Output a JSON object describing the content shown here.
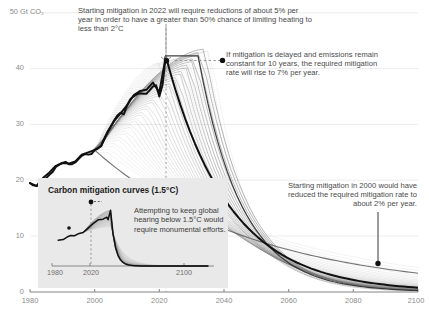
{
  "chart_data": {
    "type": "line",
    "title": "",
    "xlabel": "",
    "ylabel": "50 Gt CO2",
    "ylabel_display": "50 Gt CO₂",
    "xlim": [
      1980,
      2100
    ],
    "ylim": [
      0,
      50
    ],
    "grid": true,
    "legend_position": "none",
    "y_ticks": [
      "50 Gt CO₂",
      "40",
      "30",
      "20",
      "10",
      "0"
    ],
    "y_tick_values": [
      50,
      40,
      30,
      20,
      10,
      0
    ],
    "x_ticks": [
      "1980",
      "2000",
      "2020",
      "2040",
      "2060",
      "2080",
      "2100"
    ],
    "x_tick_values": [
      1980,
      2000,
      2020,
      2040,
      2060,
      2080,
      2100
    ],
    "series": [
      {
        "name": "Historical emissions",
        "style": "thick-black",
        "x": [
          1980,
          1982,
          1984,
          1986,
          1988,
          1990,
          1992,
          1994,
          1996,
          1998,
          2000,
          2002,
          2004,
          2006,
          2008,
          2010,
          2012,
          2014,
          2016,
          2018,
          2020,
          2022
        ],
        "values": [
          19.5,
          19.0,
          20.4,
          21.4,
          22.6,
          23.1,
          23.0,
          23.4,
          24.6,
          25.0,
          25.4,
          26.2,
          28.6,
          30.6,
          32.0,
          33.4,
          35.2,
          36.0,
          36.2,
          37.5,
          35.8,
          42.2
        ]
      },
      {
        "name": "Mitigation from 2022 (5% per year)",
        "style": "thick-black",
        "annotation_rate_percent": 5,
        "start_year": 2022,
        "x": [
          2022,
          2030,
          2040,
          2050,
          2060,
          2070,
          2080,
          2090,
          2100
        ],
        "values": [
          42.2,
          38.0,
          28.5,
          18.5,
          10.5,
          5.6,
          3.0,
          1.6,
          0.9
        ]
      },
      {
        "name": "Delayed mitigation, constant 10 years (7% per year)",
        "style": "thin-gray",
        "annotation_rate_percent": 7,
        "start_year": 2032,
        "x": [
          2022,
          2032,
          2040,
          2050,
          2060,
          2070,
          2080,
          2090,
          2100
        ],
        "values": [
          42.2,
          42.2,
          35.0,
          20.0,
          9.5,
          4.4,
          2.0,
          0.9,
          0.4
        ]
      },
      {
        "name": "Mitigation from 2000 (2% per year)",
        "style": "thin-gray",
        "annotation_rate_percent": 2,
        "start_year": 2000,
        "x": [
          2000,
          2020,
          2040,
          2060,
          2080,
          2100
        ],
        "values": [
          25.4,
          22.0,
          17.5,
          13.0,
          9.4,
          6.4
        ]
      }
    ],
    "markers": [
      {
        "name": "peak-2022-marker",
        "x": 2022,
        "y": 42.2
      },
      {
        "name": "delayed-constant-marker",
        "x": 2032,
        "y": 42.4
      },
      {
        "name": "year-2100-2percent-marker",
        "x": 2099,
        "y": 6.4
      }
    ],
    "reference_lines": [
      {
        "name": "year-2022-dashed",
        "orientation": "vertical",
        "x": 2022,
        "style": "dashed"
      }
    ]
  },
  "annotations": {
    "start_2022": "Starting mitigation in 2022 will require reductions of about 5% per year in order to have a greater than 50% chance of limiting heating to less than 2°C",
    "delayed": "If mitigation is delayed and emissions remain constant for 10 years, the required mitigation rate will rise to 7% per year.",
    "start_2000": "Starting mitigation in 2000 would have reduced the required mitigation rate to about 2% per year."
  },
  "y_axis": {
    "top_label": "50 Gt CO₂",
    "t40": "40",
    "t30": "30",
    "t20": "20",
    "t10": "10",
    "t0": "0"
  },
  "x_axis": {
    "t1980": "1980",
    "t2000": "2000",
    "t2020": "2020",
    "t2040": "2040",
    "t2060": "2060",
    "t2080": "2080",
    "t2100": "2100"
  },
  "inset": {
    "title": "Carbon mitigation curves (1.5°C)",
    "note": "Attempting to keep global hearing below 1.5°C would require monumental efforts.",
    "x_ticks": [
      "1980",
      "2020",
      "2100"
    ],
    "t1980": "1980",
    "t2020": "2020",
    "t2100": "2100",
    "chart_data": {
      "type": "line",
      "xlim": [
        1975,
        2105
      ],
      "ylim": [
        0,
        50
      ],
      "grid": false,
      "series": [
        {
          "name": "Historical emissions (inset)",
          "style": "thick-black",
          "x": [
            1980,
            1990,
            2000,
            2010,
            2020,
            2022
          ],
          "values": [
            19.5,
            23.1,
            25.4,
            33.4,
            35.8,
            42.2
          ]
        },
        {
          "name": "1.5C mitigation pathway (inset)",
          "style": "thick-black",
          "x": [
            2022,
            2026,
            2030,
            2040,
            2050,
            2060,
            2080,
            2100
          ],
          "values": [
            42.2,
            20.0,
            9.0,
            2.8,
            1.4,
            0.9,
            0.5,
            0.3
          ]
        }
      ],
      "markers": [
        {
          "name": "inset-peak-marker",
          "x": 2022,
          "y": 42.2
        }
      ],
      "reference_lines": [
        {
          "name": "inset-year-2020-dashed",
          "orientation": "vertical",
          "x": 2021,
          "style": "dashed"
        }
      ]
    }
  },
  "colors": {
    "background": "#ffffff",
    "main_curve": "#111111",
    "fan_curve": "#9a9a9a",
    "gridline": "#e6e6e6",
    "axis_text": "#8a8a8a",
    "annotation_text": "#4a4a4a",
    "inset_background": "#e9e9e9",
    "inset_title": "#1c1c1c"
  }
}
